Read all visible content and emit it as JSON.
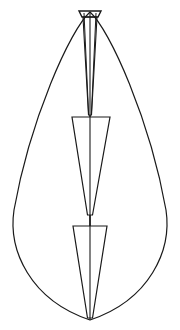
{
  "figure": {
    "title": "",
    "domain_kind": "line-diagram",
    "background_color": "#ffffff",
    "stroke_color": "#1a1a1a",
    "canvas": {
      "width": 180,
      "height": 330
    },
    "axis": {
      "name": "center-axis",
      "x": 90,
      "y_top": 12,
      "y_bottom": 320,
      "stroke_width": 1.1
    },
    "outline": {
      "name": "teardrop-outline",
      "apex": {
        "x": 90,
        "y": 12
      },
      "tip": {
        "x": 90,
        "y": 320
      },
      "left_extreme": {
        "x": 11,
        "y": 238
      },
      "right_extreme": {
        "x": 170,
        "y": 238
      },
      "stroke_width": 1.2,
      "path": "M 90 12 C 70 30 30 120 14 210 C 8 250 30 300 90 320 C 150 300 172 250 166 210 C 150 120 110 30 90 12 Z"
    },
    "segments": [
      {
        "name": "top-cap-trapezoid",
        "index": 1,
        "top_y": 11,
        "bottom_y": 17,
        "top_left_x": 79,
        "top_right_x": 101,
        "bottom_left_x": 82,
        "bottom_right_x": 98,
        "stroke_width": 1.4,
        "path": "M 79 11 L 101 11 L 98 17 L 82 17 Z"
      },
      {
        "name": "upper-taper-cone",
        "index": 2,
        "top_y": 17,
        "bottom_y": 115,
        "top_left_x": 83,
        "top_right_x": 97,
        "bottom_left_x": 88,
        "bottom_right_x": 92,
        "stroke_width": 1.1,
        "path": "M 83 17 L 97 17 L 91.5 115 L 88.5 115 Z"
      },
      {
        "name": "middle-trapezoid",
        "index": 3,
        "top_y": 117,
        "bottom_y": 215,
        "top_left_x": 72,
        "top_right_x": 110,
        "bottom_left_x": 87,
        "bottom_right_x": 93,
        "stroke_width": 1.2,
        "path": "M 72 117 L 110 117 L 92.5 215 L 87.5 215 Z"
      },
      {
        "name": "lower-trapezoid",
        "index": 4,
        "top_y": 226,
        "bottom_y": 318,
        "top_left_x": 73,
        "top_right_x": 107,
        "bottom_left_x": 88,
        "bottom_right_x": 93,
        "stroke_width": 1.2,
        "path": "M 73 226 L 107 226 L 92.5 318 L 87.5 318 Z"
      }
    ],
    "connectors": [
      {
        "name": "upper-connector-stem",
        "path": "M 90 115 L 90 117",
        "stroke_width": 1.4
      },
      {
        "name": "middle-connector-stem",
        "path": "M 90 215 L 90 226",
        "stroke_width": 1.6
      }
    ],
    "apex_spokes": [
      {
        "name": "apex-spoke-left-inner",
        "path": "M 84 13 L 88.6 114",
        "stroke_width": 1.0
      },
      {
        "name": "apex-spoke-right-inner",
        "path": "M 96 13 L 91.4 114",
        "stroke_width": 1.0
      }
    ]
  }
}
